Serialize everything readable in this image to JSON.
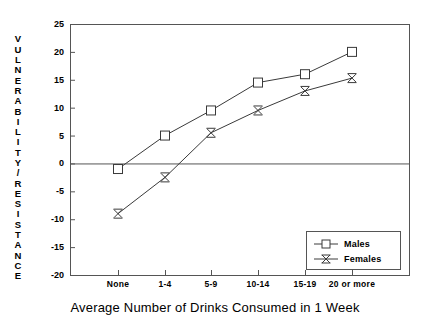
{
  "chart_data": {
    "type": "line",
    "title": "",
    "xlabel": "Average Number of Drinks Consumed in 1 Week",
    "ylabel": "VULNERABILITY/RESISTANCE",
    "categories": [
      "None",
      "1-4",
      "5-9",
      "10-14",
      "15-19",
      "20 or more"
    ],
    "series": [
      {
        "name": "Males",
        "marker": "square",
        "values": [
          -1,
          5,
          9.5,
          14.5,
          16,
          20
        ]
      },
      {
        "name": "Females",
        "marker": "x",
        "values": [
          -9,
          -2.5,
          5.5,
          9.5,
          13,
          15.3
        ]
      }
    ],
    "ylim": [
      -20,
      25
    ],
    "y_ticks": [
      25,
      20,
      15,
      10,
      5,
      0,
      -5,
      -10,
      -15,
      -20
    ],
    "y_tick_labels": [
      "25",
      "20",
      "15",
      "10",
      "5",
      "0",
      "-5",
      "-10",
      "-15",
      "-20"
    ],
    "grid": false,
    "zero_line": true,
    "legend_position": "bottom-right",
    "legend_entries": [
      "Males",
      "Females"
    ]
  },
  "axis": {
    "y_title_letters": [
      "V",
      "U",
      "L",
      "N",
      "E",
      "R",
      "A",
      "B",
      "I",
      "L",
      "I",
      "T",
      "Y",
      "/",
      "R",
      "E",
      "S",
      "I",
      "S",
      "T",
      "A",
      "N",
      "C",
      "E"
    ],
    "y_title_text": "VULNERABILITY/RESISTANCE",
    "x_title": "Average Number of Drinks Consumed in 1 Week"
  },
  "colors": {
    "line": "#3a3a3a",
    "axis": "#555555",
    "marker_fill": "#ffffff",
    "background": "#ffffff",
    "text": "#000000"
  }
}
